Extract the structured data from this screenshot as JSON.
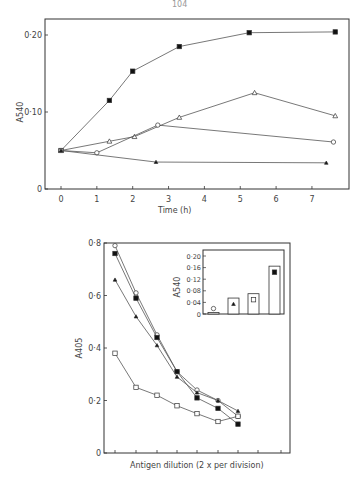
{
  "page_number": "104",
  "chart_data": [
    {
      "type": "line",
      "title": "",
      "xlabel": "Time (h)",
      "ylabel": "A540",
      "xlim": [
        -0.4,
        8.1
      ],
      "ylim": [
        0,
        0.22
      ],
      "x_ticks": [
        "0",
        "1",
        "2",
        "3",
        "4",
        "5",
        "6",
        "7"
      ],
      "y_ticks": [
        "0",
        "0·10",
        "0·20"
      ],
      "grid": false,
      "series": [
        {
          "name": "filled-square",
          "marker": "filled-square",
          "x": [
            0,
            1.35,
            2.0,
            3.3,
            5.25,
            7.65
          ],
          "y": [
            0.05,
            0.115,
            0.153,
            0.185,
            0.203,
            0.204
          ]
        },
        {
          "name": "open-triangle",
          "marker": "open-triangle",
          "x": [
            0,
            1.35,
            2.05,
            3.3,
            5.4,
            7.65
          ],
          "y": [
            0.05,
            0.062,
            0.068,
            0.093,
            0.125,
            0.095
          ]
        },
        {
          "name": "open-circle",
          "marker": "open-circle",
          "x": [
            0,
            1.0,
            2.7,
            7.6
          ],
          "y": [
            0.05,
            0.047,
            0.083,
            0.061
          ]
        },
        {
          "name": "filled-triangle",
          "marker": "filled-triangle",
          "x": [
            0,
            2.65,
            7.4
          ],
          "y": [
            0.05,
            0.035,
            0.034
          ]
        }
      ]
    },
    {
      "type": "line",
      "title": "",
      "xlabel": "Antigen dilution (2 x per division)",
      "ylabel": "A405",
      "ylim": [
        0,
        0.8
      ],
      "y_ticks": [
        "0",
        "0·2",
        "0·4",
        "0·6",
        "0·8"
      ],
      "x_tick_count": 9,
      "grid": false,
      "categories": [
        1,
        2,
        3,
        4,
        5,
        6,
        7
      ],
      "series": [
        {
          "name": "open-circle",
          "marker": "open-circle",
          "values": [
            0.79,
            0.61,
            0.45,
            0.31,
            0.24,
            0.2,
            0.14
          ]
        },
        {
          "name": "filled-square",
          "marker": "filled-square",
          "values": [
            0.76,
            0.59,
            0.44,
            0.31,
            0.21,
            0.17,
            0.11
          ]
        },
        {
          "name": "filled-triangle",
          "marker": "filled-triangle",
          "values": [
            0.66,
            0.52,
            0.41,
            0.29,
            0.23,
            0.2,
            0.16
          ]
        },
        {
          "name": "open-square",
          "marker": "open-square",
          "values": [
            0.38,
            0.25,
            0.22,
            0.18,
            0.15,
            0.12,
            0.14
          ]
        }
      ]
    },
    {
      "type": "bar",
      "title": "inset",
      "xlabel": "",
      "ylabel": "A540",
      "ylim": [
        0,
        0.22
      ],
      "y_ticks": [
        "0",
        "0·04",
        "0·08",
        "0·12",
        "0·16",
        "0·20"
      ],
      "categories": [
        "open-circle",
        "filled-triangle",
        "open-square",
        "filled-square"
      ],
      "values": [
        0.005,
        0.055,
        0.07,
        0.165
      ]
    }
  ]
}
